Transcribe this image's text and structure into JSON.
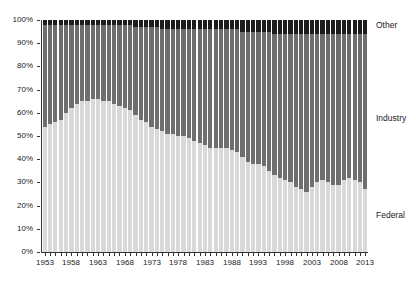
{
  "chart_data": {
    "type": "bar",
    "stacked": true,
    "stack_mode": "percent",
    "title": "",
    "subtitle": "",
    "xlabel": "",
    "ylabel": "",
    "ylim": [
      0,
      100
    ],
    "ytick_labels": [
      "0%",
      "10%",
      "20%",
      "30%",
      "40%",
      "50%",
      "60%",
      "70%",
      "80%",
      "90%",
      "100%"
    ],
    "ytick_values": [
      0,
      10,
      20,
      30,
      40,
      50,
      60,
      70,
      80,
      90,
      100
    ],
    "grid": false,
    "legend_position": "right",
    "xtick_labels": [
      "1953",
      "1958",
      "1963",
      "1968",
      "1973",
      "1978",
      "1983",
      "1988",
      "1993",
      "1998",
      "2003",
      "2008",
      "2013"
    ],
    "xtick_values": [
      1953,
      1958,
      1963,
      1968,
      1973,
      1978,
      1983,
      1988,
      1993,
      1998,
      2003,
      2008,
      2013
    ],
    "categories": [
      1953,
      1954,
      1955,
      1956,
      1957,
      1958,
      1959,
      1960,
      1961,
      1962,
      1963,
      1964,
      1965,
      1966,
      1967,
      1968,
      1969,
      1970,
      1971,
      1972,
      1973,
      1974,
      1975,
      1976,
      1977,
      1978,
      1979,
      1980,
      1981,
      1982,
      1983,
      1984,
      1985,
      1986,
      1987,
      1988,
      1989,
      1990,
      1991,
      1992,
      1993,
      1994,
      1995,
      1996,
      1997,
      1998,
      1999,
      2000,
      2001,
      2002,
      2003,
      2004,
      2005,
      2006,
      2007,
      2008,
      2009,
      2010,
      2011,
      2012,
      2013
    ],
    "series": [
      {
        "name": "Federal",
        "color": "#d9d9d9",
        "values": [
          54,
          55,
          56,
          57,
          60,
          62,
          64,
          65,
          65,
          66,
          66,
          65,
          65,
          64,
          63,
          62,
          61,
          59,
          57,
          56,
          54,
          53,
          52,
          51,
          51,
          50,
          50,
          49,
          48,
          47,
          46,
          45,
          45,
          45,
          45,
          44,
          43,
          41,
          39,
          38,
          38,
          37,
          35,
          33,
          32,
          31,
          30,
          28,
          27,
          26,
          28,
          30,
          31,
          30,
          29,
          29,
          31,
          32,
          31,
          30,
          27
        ]
      },
      {
        "name": "Industry",
        "color": "#6e6e6e",
        "values": [
          44,
          43,
          42,
          41,
          38,
          36,
          34,
          33,
          33,
          32,
          32,
          33,
          33,
          34,
          35,
          36,
          37,
          38,
          40,
          41,
          43,
          44,
          44,
          45,
          45,
          46,
          46,
          47,
          48,
          49,
          50,
          51,
          51,
          51,
          51,
          52,
          53,
          54,
          56,
          57,
          57,
          58,
          60,
          61,
          62,
          63,
          64,
          66,
          67,
          68,
          66,
          64,
          63,
          64,
          65,
          65,
          63,
          62,
          63,
          64,
          67
        ]
      },
      {
        "name": "Other",
        "color": "#1c1c1c",
        "values": [
          2,
          2,
          2,
          2,
          2,
          2,
          2,
          2,
          2,
          2,
          2,
          2,
          2,
          2,
          2,
          2,
          2,
          3,
          3,
          3,
          3,
          3,
          4,
          4,
          4,
          4,
          4,
          4,
          4,
          4,
          4,
          4,
          4,
          4,
          4,
          4,
          4,
          5,
          5,
          5,
          5,
          5,
          5,
          6,
          6,
          6,
          6,
          6,
          6,
          6,
          6,
          6,
          6,
          6,
          6,
          6,
          6,
          6,
          6,
          6,
          6
        ]
      }
    ]
  },
  "legend": {
    "items": [
      {
        "label": "Other"
      },
      {
        "label": "Industry"
      },
      {
        "label": "Federal"
      }
    ]
  }
}
